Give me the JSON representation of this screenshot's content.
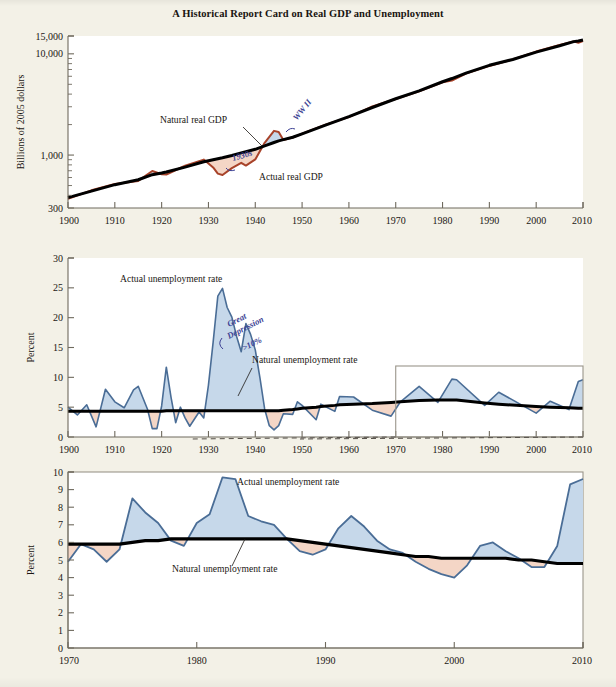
{
  "figure": {
    "title": "A Historical Report Card on Real GDP and Unemployment",
    "background_color": "#f3f1e7",
    "plot_background_color": "#ffffff"
  },
  "colors": {
    "natural_line": "#000000",
    "actual_gdp_line": "#a8432a",
    "actual_unemployment_line": "#4a6d96",
    "above_fill": "#c6d8ea",
    "below_fill": "#f4d6c6",
    "handwriting": "#3b3f93",
    "axis": "#6f6a5e"
  },
  "panels": [
    {
      "id": "gdp",
      "ylabel": "Billions of 2005 dollars",
      "yscale": "log",
      "ylim": [
        300,
        15000
      ],
      "yticks": [
        300,
        1000,
        10000,
        15000
      ],
      "ytick_labels": [
        "300",
        "1,000",
        "10,000",
        "15,000"
      ],
      "xlim": [
        1900,
        2010
      ],
      "xticks": [
        1900,
        1910,
        1920,
        1930,
        1940,
        1950,
        1960,
        1970,
        1980,
        1990,
        2000,
        2010
      ],
      "xtick_labels": [
        "1900",
        "1910",
        "1920",
        "1930",
        "1940",
        "1950",
        "1960",
        "1970",
        "1980",
        "1990",
        "2000",
        "2010"
      ],
      "annotations": [
        {
          "name": "natural-real-gdp-label",
          "text": "Natural real GDP"
        },
        {
          "name": "actual-real-gdp-label",
          "text": "Actual real GDP"
        },
        {
          "name": "handwritten-1930s",
          "text": "1930s"
        },
        {
          "name": "handwritten-wwii",
          "text": "WW II"
        }
      ]
    },
    {
      "id": "unemployment-long",
      "ylabel": "Percent",
      "yscale": "linear",
      "ylim": [
        0,
        30
      ],
      "yticks": [
        0,
        5,
        10,
        15,
        20,
        25,
        30
      ],
      "ytick_labels": [
        "0",
        "5",
        "10",
        "15",
        "20",
        "25",
        "30"
      ],
      "xlim": [
        1900,
        2010
      ],
      "xticks": [
        1900,
        1910,
        1920,
        1930,
        1940,
        1950,
        1960,
        1970,
        1980,
        1990,
        2000,
        2010
      ],
      "xtick_labels": [
        "1900",
        "1910",
        "1920",
        "1930",
        "1940",
        "1950",
        "1960",
        "1970",
        "1980",
        "1990",
        "2000",
        "2010"
      ],
      "annotations": [
        {
          "name": "actual-unemployment-label",
          "text": "Actual unemployment rate"
        },
        {
          "name": "natural-unemployment-label",
          "text": "Natural unemployment rate"
        },
        {
          "name": "handwritten-great-depression",
          "text": "Great"
        },
        {
          "name": "handwritten-great-depression-2",
          "text": "Depression"
        },
        {
          "name": "handwritten-great-depression-3",
          "text": ">10%"
        }
      ],
      "inset_box": {
        "from": 1970,
        "to": 2010
      }
    },
    {
      "id": "unemployment-recent",
      "ylabel": "Percent",
      "yscale": "linear",
      "ylim": [
        0,
        10
      ],
      "yticks": [
        0,
        1,
        2,
        3,
        4,
        5,
        6,
        7,
        8,
        9,
        10
      ],
      "ytick_labels": [
        "0",
        "1",
        "2",
        "3",
        "4",
        "5",
        "6",
        "7",
        "8",
        "9",
        "10"
      ],
      "xlim": [
        1970,
        2010
      ],
      "xticks": [
        1970,
        1980,
        1990,
        2000,
        2010
      ],
      "xtick_labels": [
        "1970",
        "1980",
        "1990",
        "2000",
        "2010"
      ],
      "annotations": [
        {
          "name": "actual-unemployment-label",
          "text": "Actual unemployment rate"
        },
        {
          "name": "natural-unemployment-label",
          "text": "Natural unemployment rate"
        }
      ]
    }
  ],
  "chart_data": [
    {
      "type": "line",
      "id": "gdp",
      "title": "A Historical Report Card on Real GDP and Unemployment",
      "xlabel": "",
      "ylabel": "Billions of 2005 dollars",
      "yscale": "log",
      "ylim": [
        300,
        15000
      ],
      "xlim": [
        1900,
        2010
      ],
      "grid": false,
      "legend": "inline-annotations",
      "x": [
        1900,
        1905,
        1910,
        1915,
        1918,
        1920,
        1921,
        1925,
        1929,
        1930,
        1931,
        1932,
        1933,
        1935,
        1937,
        1938,
        1940,
        1942,
        1944,
        1945,
        1946,
        1948,
        1950,
        1955,
        1960,
        1965,
        1970,
        1975,
        1980,
        1982,
        1985,
        1990,
        1995,
        2000,
        2005,
        2008,
        2009,
        2010
      ],
      "series": [
        {
          "name": "Natural real GDP",
          "color": "#000000",
          "values": [
            380,
            440,
            510,
            570,
            640,
            665,
            680,
            760,
            860,
            880,
            900,
            920,
            940,
            990,
            1050,
            1080,
            1140,
            1230,
            1330,
            1380,
            1420,
            1500,
            1620,
            1980,
            2400,
            2950,
            3600,
            4300,
            5300,
            5700,
            6450,
            7700,
            8800,
            10400,
            12000,
            13200,
            13400,
            13700
          ]
        },
        {
          "name": "Actual real GDP",
          "color": "#a8432a",
          "values": [
            370,
            450,
            515,
            560,
            690,
            650,
            640,
            785,
            905,
            820,
            760,
            650,
            640,
            740,
            840,
            790,
            900,
            1330,
            1720,
            1700,
            1400,
            1490,
            1630,
            1990,
            2390,
            3000,
            3600,
            4250,
            5250,
            5450,
            6350,
            7650,
            8750,
            10600,
            12200,
            13300,
            12900,
            13300
          ]
        }
      ]
    },
    {
      "type": "line",
      "id": "unemployment-long",
      "title": "",
      "xlabel": "",
      "ylabel": "Percent",
      "ylim": [
        0,
        30
      ],
      "xlim": [
        1900,
        2010
      ],
      "grid": false,
      "legend": "inline-annotations",
      "x": [
        1900,
        1902,
        1904,
        1906,
        1908,
        1910,
        1912,
        1914,
        1915,
        1917,
        1918,
        1919,
        1920,
        1921,
        1922,
        1923,
        1924,
        1925,
        1926,
        1928,
        1929,
        1930,
        1931,
        1932,
        1933,
        1934,
        1935,
        1936,
        1937,
        1938,
        1939,
        1940,
        1941,
        1942,
        1943,
        1944,
        1945,
        1946,
        1948,
        1949,
        1950,
        1953,
        1954,
        1957,
        1958,
        1961,
        1965,
        1969,
        1971,
        1975,
        1979,
        1982,
        1983,
        1989,
        1992,
        2000,
        2003,
        2007,
        2009,
        2010
      ],
      "series": [
        {
          "name": "Actual unemployment rate",
          "color": "#4a6d96",
          "values": [
            5.0,
            3.7,
            5.4,
            1.7,
            8.0,
            5.9,
            4.9,
            7.9,
            8.5,
            4.6,
            1.4,
            1.4,
            5.2,
            11.7,
            6.7,
            2.4,
            5.0,
            3.2,
            1.8,
            4.2,
            3.2,
            8.7,
            15.9,
            23.6,
            24.9,
            21.7,
            20.1,
            16.9,
            14.3,
            19.0,
            17.2,
            14.6,
            9.9,
            4.7,
            1.9,
            1.2,
            1.9,
            3.9,
            3.8,
            5.9,
            5.3,
            2.9,
            5.5,
            4.3,
            6.8,
            6.7,
            4.5,
            3.5,
            5.9,
            8.5,
            5.8,
            9.7,
            9.6,
            5.3,
            7.5,
            4.0,
            6.0,
            4.6,
            9.3,
            9.6
          ]
        },
        {
          "name": "Natural unemployment rate",
          "color": "#000000",
          "values": [
            4.3,
            4.3,
            4.3,
            4.3,
            4.3,
            4.3,
            4.3,
            4.3,
            4.3,
            4.3,
            4.3,
            4.3,
            4.3,
            4.4,
            4.4,
            4.4,
            4.4,
            4.4,
            4.4,
            4.4,
            4.4,
            4.4,
            4.4,
            4.4,
            4.4,
            4.4,
            4.4,
            4.4,
            4.4,
            4.4,
            4.4,
            4.4,
            4.4,
            4.4,
            4.4,
            4.4,
            4.4,
            4.5,
            4.6,
            4.7,
            4.8,
            5.0,
            5.1,
            5.3,
            5.4,
            5.5,
            5.6,
            5.8,
            5.9,
            6.1,
            6.2,
            6.2,
            6.2,
            5.7,
            5.5,
            5.1,
            5.0,
            4.9,
            4.8,
            4.8
          ]
        }
      ]
    },
    {
      "type": "line",
      "id": "unemployment-recent",
      "title": "",
      "xlabel": "",
      "ylabel": "Percent",
      "ylim": [
        0,
        10
      ],
      "xlim": [
        1970,
        2010
      ],
      "grid": false,
      "legend": "inline-annotations",
      "x": [
        1970,
        1971,
        1972,
        1973,
        1974,
        1975,
        1976,
        1977,
        1978,
        1979,
        1980,
        1981,
        1982,
        1983,
        1984,
        1985,
        1986,
        1987,
        1988,
        1989,
        1990,
        1991,
        1992,
        1993,
        1994,
        1995,
        1996,
        1997,
        1998,
        1999,
        2000,
        2001,
        2002,
        2003,
        2004,
        2005,
        2006,
        2007,
        2008,
        2009,
        2010
      ],
      "series": [
        {
          "name": "Actual unemployment rate",
          "color": "#4a6d96",
          "values": [
            4.9,
            5.9,
            5.6,
            4.9,
            5.6,
            8.5,
            7.7,
            7.1,
            6.1,
            5.8,
            7.1,
            7.6,
            9.7,
            9.6,
            7.5,
            7.2,
            7.0,
            6.2,
            5.5,
            5.3,
            5.6,
            6.8,
            7.5,
            6.9,
            6.1,
            5.6,
            5.4,
            4.9,
            4.5,
            4.2,
            4.0,
            4.7,
            5.8,
            6.0,
            5.5,
            5.1,
            4.6,
            4.6,
            5.8,
            9.3,
            9.6
          ]
        },
        {
          "name": "Natural unemployment rate",
          "color": "#000000",
          "values": [
            5.9,
            5.9,
            5.9,
            5.9,
            5.9,
            6.0,
            6.1,
            6.1,
            6.2,
            6.2,
            6.2,
            6.2,
            6.2,
            6.2,
            6.2,
            6.2,
            6.2,
            6.2,
            6.1,
            6.0,
            5.9,
            5.8,
            5.7,
            5.6,
            5.5,
            5.4,
            5.3,
            5.2,
            5.2,
            5.1,
            5.1,
            5.1,
            5.1,
            5.1,
            5.1,
            5.0,
            5.0,
            4.9,
            4.8,
            4.8,
            4.8
          ]
        }
      ]
    }
  ]
}
